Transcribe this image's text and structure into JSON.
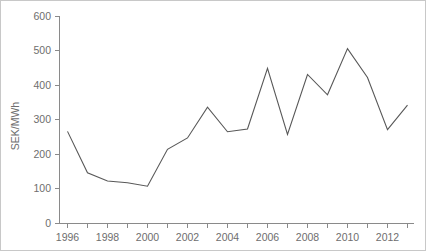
{
  "chart_data": {
    "type": "line",
    "title": "",
    "subtitle": "",
    "xlabel": "",
    "ylabel": "SEK/MWh",
    "ylim": [
      0,
      600
    ],
    "xlim": [
      1996,
      2013
    ],
    "grid": false,
    "legend": false,
    "legend_position": "none",
    "ytick_labels": [
      "600",
      "500",
      "400",
      "300",
      "200",
      "100",
      "0"
    ],
    "ytick_values": [
      600,
      500,
      400,
      300,
      200,
      100,
      0
    ],
    "xtick_labels": [
      "1996",
      "1998",
      "2000",
      "2002",
      "2004",
      "2006",
      "2008",
      "2010",
      "2012"
    ],
    "xtick_values": [
      1996,
      1998,
      2000,
      2002,
      2004,
      2006,
      2008,
      2010,
      2012
    ],
    "x": [
      1996,
      1997,
      1998,
      1999,
      2000,
      2001,
      2002,
      2003,
      2004,
      2005,
      2006,
      2007,
      2008,
      2009,
      2010,
      2011,
      2012,
      2013
    ],
    "series": [
      {
        "name": "SEK/MWh",
        "color": "#585858",
        "values": [
          267,
          147,
          123,
          118,
          108,
          215,
          248,
          337,
          266,
          274,
          450,
          258,
          432,
          373,
          507,
          423,
          272,
          343
        ]
      }
    ],
    "annotations": []
  },
  "axes": {
    "y_axis_label": "SEK/MWh",
    "axis_color": "#8a8a8a",
    "tick_text_color": "#6e6e6e"
  },
  "figure": {
    "background_color": "#ffffff",
    "border_color": "#c8c8c8",
    "line_color": "#585858"
  }
}
